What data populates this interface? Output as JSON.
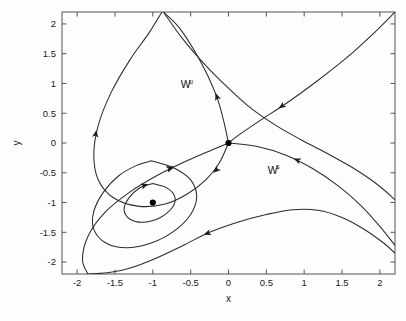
{
  "chart_data": {
    "type": "line",
    "title": "",
    "subtitle": "",
    "xlabel": "x",
    "ylabel": "y",
    "xlim": [
      -2.2,
      2.2
    ],
    "ylim": [
      -2.2,
      2.2
    ],
    "grid": false,
    "legend_position": "none",
    "xticks": [
      "-2",
      "-1.5",
      "-1",
      "-0.5",
      "0",
      "0.5",
      "1",
      "1.5",
      "2"
    ],
    "xtick_values": [
      -2,
      -1.5,
      -1,
      -0.5,
      0,
      0.5,
      1,
      1.5,
      2
    ],
    "yticks": [
      "2",
      "1.5",
      "1",
      "0.5",
      "0",
      "-0.5",
      "-1",
      "-1.5",
      "-2"
    ],
    "ytick_values": [
      2,
      1.5,
      1,
      0.5,
      0,
      -0.5,
      -1,
      -1.5,
      -2
    ],
    "annotations": [
      {
        "name": "unstable-manifold-label",
        "text": "W",
        "superscript": "u",
        "x": -0.63,
        "y": 0.92
      },
      {
        "name": "stable-manifold-label",
        "text": "W",
        "superscript": "s",
        "x": 0.52,
        "y": -0.52
      }
    ],
    "fixed_points": [
      {
        "name": "saddle-point",
        "x": 0.0,
        "y": 0.0,
        "kind": "saddle"
      },
      {
        "name": "center-point",
        "x": -1.0,
        "y": -1.0,
        "kind": "center"
      }
    ],
    "series": [
      {
        "name": "unstable-manifold-upper-branch",
        "points": [
          [
            0,
            0
          ],
          [
            -0.06,
            0.35
          ],
          [
            -0.14,
            0.72
          ],
          [
            -0.27,
            1.12
          ],
          [
            -0.45,
            1.55
          ],
          [
            -0.66,
            1.95
          ],
          [
            -0.86,
            2.2
          ]
        ],
        "arrows": [
          {
            "x": -0.17,
            "y": 0.84,
            "dx": -0.26,
            "dy": 0.96
          }
        ]
      },
      {
        "name": "unstable-manifold-lower-branch",
        "points": [
          [
            0,
            0
          ],
          [
            -0.12,
            -0.33
          ],
          [
            -0.3,
            -0.62
          ],
          [
            -0.55,
            -0.86
          ],
          [
            -0.85,
            -1.03
          ],
          [
            -1.2,
            -1.06
          ],
          [
            -1.52,
            -0.92
          ],
          [
            -1.72,
            -0.62
          ],
          [
            -1.78,
            -0.2
          ],
          [
            -1.72,
            0.3
          ],
          [
            -1.55,
            0.85
          ],
          [
            -1.3,
            1.4
          ],
          [
            -1.05,
            1.85
          ],
          [
            -0.88,
            2.2
          ]
        ],
        "arrows": [
          {
            "x": -0.2,
            "y": -0.5,
            "dx": -0.55,
            "dy": -0.62
          },
          {
            "x": -1.745,
            "y": 0.22,
            "dx": 0.13,
            "dy": 1.0
          }
        ]
      },
      {
        "name": "stable-manifold-left-branch",
        "points": [
          [
            0,
            0
          ],
          [
            -0.3,
            -0.16
          ],
          [
            -0.62,
            -0.34
          ],
          [
            -0.95,
            -0.55
          ],
          [
            -1.3,
            -0.82
          ],
          [
            -1.62,
            -1.15
          ],
          [
            -1.85,
            -1.55
          ],
          [
            -1.93,
            -1.95
          ],
          [
            -1.86,
            -2.2
          ]
        ],
        "arrows": [
          {
            "x": -0.72,
            "y": -0.39,
            "dx": 0.72,
            "dy": 0.42
          }
        ]
      },
      {
        "name": "stable-manifold-right-branch",
        "points": [
          [
            0,
            0
          ],
          [
            0.38,
            -0.06
          ],
          [
            0.75,
            -0.2
          ],
          [
            1.1,
            -0.42
          ],
          [
            1.45,
            -0.72
          ],
          [
            1.75,
            -1.05
          ],
          [
            2.0,
            -1.4
          ],
          [
            2.2,
            -1.72
          ]
        ],
        "arrows": [
          {
            "x": 0.86,
            "y": -0.26,
            "dx": -0.8,
            "dy": 0.42
          }
        ]
      },
      {
        "name": "stable-manifold-incoming-upper-right",
        "points": [
          [
            2.2,
            2.2
          ],
          [
            1.9,
            1.82
          ],
          [
            1.55,
            1.42
          ],
          [
            1.15,
            1.02
          ],
          [
            0.78,
            0.68
          ],
          [
            0.42,
            0.38
          ],
          [
            0.12,
            0.12
          ],
          [
            0,
            0
          ]
        ],
        "arrows": [
          {
            "x": 0.66,
            "y": 0.58,
            "dx": -0.82,
            "dy": -0.7
          }
        ]
      },
      {
        "name": "homoclinic-loop-outer",
        "points": [
          [
            -0.86,
            2.2
          ],
          [
            -0.6,
            1.74
          ],
          [
            -0.3,
            1.3
          ],
          [
            0.0,
            0.92
          ],
          [
            0.3,
            0.58
          ],
          [
            0.62,
            0.3
          ],
          [
            0.95,
            0.06
          ],
          [
            1.28,
            -0.16
          ],
          [
            1.62,
            -0.4
          ],
          [
            1.95,
            -0.68
          ],
          [
            2.2,
            -0.95
          ]
        ],
        "arrows": []
      },
      {
        "name": "trajectory-lower-loop",
        "points": [
          [
            -1.86,
            -2.2
          ],
          [
            -1.6,
            -2.18
          ],
          [
            -1.3,
            -2.1
          ],
          [
            -0.95,
            -1.93
          ],
          [
            -0.6,
            -1.72
          ],
          [
            -0.25,
            -1.5
          ],
          [
            0.12,
            -1.33
          ],
          [
            0.5,
            -1.2
          ],
          [
            0.85,
            -1.12
          ],
          [
            1.18,
            -1.13
          ],
          [
            1.5,
            -1.25
          ],
          [
            1.78,
            -1.44
          ],
          [
            2.05,
            -1.68
          ],
          [
            2.2,
            -1.85
          ]
        ],
        "arrows": [
          {
            "x": -0.33,
            "y": -1.54,
            "dx": -0.92,
            "dy": -0.42
          }
        ]
      },
      {
        "name": "spiral-inner-ellipse",
        "points": [
          [
            -1.0,
            -0.68
          ],
          [
            -0.82,
            -0.75
          ],
          [
            -0.71,
            -0.9
          ],
          [
            -0.74,
            -1.08
          ],
          [
            -0.9,
            -1.25
          ],
          [
            -1.12,
            -1.33
          ],
          [
            -1.3,
            -1.28
          ],
          [
            -1.38,
            -1.12
          ],
          [
            -1.32,
            -0.93
          ],
          [
            -1.18,
            -0.76
          ],
          [
            -1.0,
            -0.68
          ]
        ],
        "arrows": [
          {
            "x": -1.06,
            "y": -0.69,
            "dx": 0.72,
            "dy": 0.34
          }
        ]
      },
      {
        "name": "spiral-outer-ellipse",
        "points": [
          [
            -1.02,
            -0.3
          ],
          [
            -0.72,
            -0.42
          ],
          [
            -0.5,
            -0.62
          ],
          [
            -0.42,
            -0.9
          ],
          [
            -0.5,
            -1.2
          ],
          [
            -0.72,
            -1.48
          ],
          [
            -1.02,
            -1.68
          ],
          [
            -1.35,
            -1.76
          ],
          [
            -1.62,
            -1.68
          ],
          [
            -1.78,
            -1.45
          ],
          [
            -1.78,
            -1.15
          ],
          [
            -1.65,
            -0.82
          ],
          [
            -1.45,
            -0.55
          ],
          [
            -1.22,
            -0.38
          ],
          [
            -1.02,
            -0.3
          ]
        ],
        "arrows": [
          {
            "x": -0.72,
            "y": -0.41,
            "dx": 0.82,
            "dy": 0.3
          }
        ]
      }
    ]
  },
  "figure": {
    "background_color": "#fdfdfd",
    "axes_color": "#555555",
    "curve_color": "#2b2b2b",
    "marker_color": "#000000",
    "plot_box": {
      "left": 62,
      "top": 12,
      "right": 395,
      "bottom": 274
    }
  }
}
